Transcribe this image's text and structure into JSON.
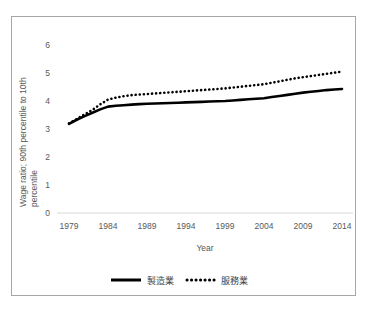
{
  "chart_data": {
    "type": "line",
    "title": "",
    "xlabel": "Year",
    "ylabel": "Wage ratio; 90th percentile to 10th percentile",
    "ylabel_line1": "Wage ratio; 90th percentile to 10th",
    "ylabel_line2": "percentile",
    "xlim": [
      1979,
      2014
    ],
    "ylim": [
      0,
      6
    ],
    "grid": false,
    "legend_position": "bottom",
    "ytick_labels": [
      "0",
      "1",
      "2",
      "3",
      "4",
      "5",
      "6"
    ],
    "ytick_values": [
      0,
      1,
      2,
      3,
      4,
      5,
      6
    ],
    "xtick_labels": [
      "1979",
      "1984",
      "1989",
      "1994",
      "1999",
      "2004",
      "2009",
      "2014"
    ],
    "xtick_values": [
      1979,
      1984,
      1989,
      1994,
      1999,
      2004,
      2009,
      2014
    ],
    "x": [
      1979,
      1980,
      1981,
      1982,
      1983,
      1984,
      1985,
      1986,
      1987,
      1988,
      1989,
      1990,
      1991,
      1992,
      1993,
      1994,
      1995,
      1996,
      1997,
      1998,
      1999,
      2000,
      2001,
      2002,
      2003,
      2004,
      2005,
      2006,
      2007,
      2008,
      2009,
      2010,
      2011,
      2012,
      2013,
      2014
    ],
    "series": [
      {
        "name": "製造業",
        "style": "solid",
        "color": "#000000",
        "values": [
          3.18,
          3.33,
          3.46,
          3.58,
          3.7,
          3.8,
          3.83,
          3.85,
          3.87,
          3.89,
          3.9,
          3.91,
          3.92,
          3.93,
          3.94,
          3.95,
          3.96,
          3.97,
          3.98,
          3.99,
          4.0,
          4.02,
          4.04,
          4.06,
          4.08,
          4.1,
          4.14,
          4.18,
          4.22,
          4.26,
          4.3,
          4.33,
          4.36,
          4.39,
          4.41,
          4.43
        ]
      },
      {
        "name": "服務業",
        "style": "dotted",
        "color": "#000000",
        "values": [
          3.2,
          3.36,
          3.52,
          3.68,
          3.88,
          4.05,
          4.12,
          4.17,
          4.21,
          4.23,
          4.25,
          4.27,
          4.29,
          4.31,
          4.33,
          4.35,
          4.37,
          4.39,
          4.41,
          4.43,
          4.45,
          4.48,
          4.51,
          4.54,
          4.57,
          4.6,
          4.65,
          4.7,
          4.76,
          4.81,
          4.85,
          4.89,
          4.93,
          4.97,
          5.01,
          5.05
        ]
      }
    ],
    "legend": [
      {
        "label": "製造業",
        "style": "solid"
      },
      {
        "label": "服務業",
        "style": "dotted"
      }
    ]
  }
}
